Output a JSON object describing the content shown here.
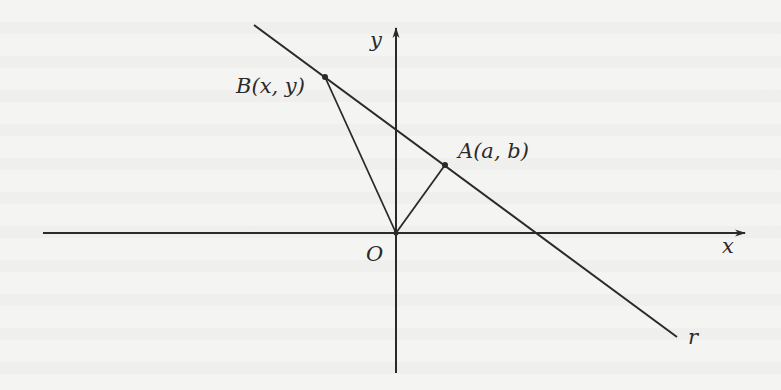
{
  "figure": {
    "type": "coordinate-geometry-diagram",
    "colors": {
      "ink": "#2a2a2a",
      "paper": "#f4f4f2"
    },
    "axes": {
      "x_label": "x",
      "y_label": "y",
      "origin_label": "O"
    },
    "line": {
      "label": "r"
    },
    "points": {
      "A": {
        "name": "A",
        "coords": "(a, b)"
      },
      "B": {
        "name": "B",
        "coords": "(x, y)"
      }
    },
    "segments": [
      "O-A",
      "O-B"
    ]
  }
}
